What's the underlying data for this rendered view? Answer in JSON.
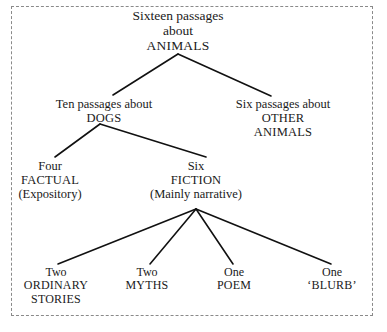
{
  "diagram": {
    "type": "tree",
    "title_text": "Sixteen passages about ANIMALS",
    "border_style": "dashed",
    "border_color": "#8a8a8a",
    "text_color": "#1a1a1a",
    "edge_color": "#111111",
    "nodes": {
      "root": {
        "id": "root",
        "line1": "Sixteen passages",
        "line2": "about",
        "line3": "ANIMALS"
      },
      "dogs": {
        "id": "dogs",
        "line1": "Ten passages about",
        "line2": "DOGS"
      },
      "other_animals": {
        "id": "other-animals",
        "line1": "Six passages about",
        "line2": "OTHER",
        "line3": "ANIMALS"
      },
      "factual": {
        "id": "factual",
        "line1": "Four",
        "line2": "FACTUAL",
        "line3": "(Expository)"
      },
      "fiction": {
        "id": "fiction",
        "line1": "Six",
        "line2": "FICTION",
        "line3": "(Mainly narrative)"
      },
      "ordinary_stories": {
        "id": "ordinary-stories",
        "line1": "Two",
        "line2": "ORDINARY",
        "line3": "STORIES"
      },
      "myths": {
        "id": "myths",
        "line1": "Two",
        "line2": "MYTHS"
      },
      "poem": {
        "id": "poem",
        "line1": "One",
        "line2": "POEM"
      },
      "blurb": {
        "id": "blurb",
        "line1": "One",
        "line2": "‘BLURB’"
      }
    },
    "edges": [
      {
        "from": "root",
        "to": "dogs"
      },
      {
        "from": "root",
        "to": "other_animals"
      },
      {
        "from": "dogs",
        "to": "factual"
      },
      {
        "from": "dogs",
        "to": "fiction"
      },
      {
        "from": "fiction",
        "to": "ordinary_stories"
      },
      {
        "from": "fiction",
        "to": "myths"
      },
      {
        "from": "fiction",
        "to": "poem"
      },
      {
        "from": "fiction",
        "to": "blurb"
      }
    ]
  }
}
